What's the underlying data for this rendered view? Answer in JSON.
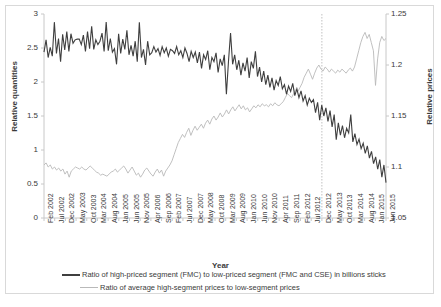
{
  "chart_data": {
    "type": "line",
    "title": "",
    "xlabel": "Year",
    "ylabel": "Relative quantities",
    "ylabel_secondary": "Relative prices",
    "ylim": [
      0,
      3
    ],
    "yticks": [
      "0",
      "0.5",
      "1",
      "1.5",
      "2",
      "2.5",
      "3"
    ],
    "ylim_secondary": [
      1.05,
      1.25
    ],
    "yticks_secondary": [
      "1.05",
      "1.1",
      "1.15",
      "1.2",
      "1.25"
    ],
    "grid": false,
    "legend_position": "bottom",
    "annotations": [
      {
        "type": "vertical-dotted-line",
        "at": "Dec 2012"
      }
    ],
    "tick_labels": [
      "Feb 2002",
      "Jul 2002",
      "Dec 2002",
      "May 2003",
      "Oct 2003",
      "Mar 2004",
      "Aug 2004",
      "Jan 2005",
      "Jun 2005",
      "Nov 2005",
      "Apr 2006",
      "Sep 2006",
      "Feb 2007",
      "Jul 2007",
      "Dec 2007",
      "May 2008",
      "Oct 2008",
      "Mar 2009",
      "Aug 2009",
      "Jan 2010",
      "Jun 2010",
      "Nov 2010",
      "Apr 2011",
      "Sep 2011",
      "Feb 2012",
      "Jul 2012",
      "Dec 2012",
      "May 2013",
      "Oct 2013",
      "Mar 2014",
      "Aug 2014",
      "Jan 2015",
      "Jun 2015"
    ],
    "x_start": "Feb 2002",
    "x_end": "Jun 2015",
    "n_points": 161,
    "series": [
      {
        "name": "Ratio of high-priced segment (FMC) to low-priced segment (FMC and CSE) in billions sticks",
        "axis": "left",
        "color": "#3f3f3f",
        "width": 1.1,
        "values": [
          2.44,
          2.62,
          2.36,
          2.51,
          2.38,
          2.88,
          2.42,
          2.64,
          2.3,
          2.7,
          2.47,
          2.74,
          2.45,
          2.71,
          2.57,
          2.62,
          2.63,
          2.63,
          2.55,
          2.69,
          2.45,
          2.74,
          2.49,
          2.82,
          2.48,
          2.62,
          2.55,
          2.6,
          2.72,
          2.45,
          2.88,
          2.46,
          2.64,
          2.44,
          2.49,
          2.26,
          2.71,
          2.42,
          2.63,
          2.48,
          2.76,
          2.4,
          2.54,
          2.38,
          2.6,
          2.3,
          2.88,
          2.36,
          2.48,
          2.25,
          2.6,
          2.4,
          2.43,
          2.52,
          2.44,
          2.49,
          2.39,
          2.52,
          2.43,
          2.5,
          2.38,
          2.48,
          2.46,
          2.42,
          2.52,
          2.4,
          2.46,
          2.36,
          2.5,
          2.42,
          2.3,
          2.45,
          2.36,
          2.44,
          2.28,
          2.44,
          2.2,
          2.4,
          2.33,
          2.46,
          2.18,
          2.36,
          2.3,
          2.43,
          2.14,
          2.34,
          2.24,
          2.4,
          1.82,
          2.3,
          2.72,
          2.26,
          2.4,
          2.18,
          2.32,
          2.1,
          2.28,
          2.16,
          2.36,
          2.06,
          2.3,
          2.2,
          2.45,
          2.08,
          2.22,
          2.0,
          2.16,
          1.96,
          2.1,
          1.92,
          2.06,
          1.88,
          2.02,
          1.95,
          2.08,
          1.9,
          1.96,
          1.82,
          1.94,
          1.86,
          1.98,
          1.8,
          1.9,
          1.77,
          1.87,
          1.72,
          1.8,
          1.66,
          1.76,
          1.7,
          1.74,
          1.55,
          1.7,
          1.44,
          1.66,
          1.5,
          1.62,
          1.42,
          1.58,
          1.34,
          1.52,
          1.15,
          1.4,
          1.22,
          1.36,
          1.18,
          1.32,
          1.25,
          1.52,
          1.12,
          1.24,
          1.08,
          1.16,
          1.02,
          1.1,
          0.95,
          1.06,
          0.88,
          0.98,
          0.8,
          0.9,
          0.72,
          0.86,
          0.6,
          0.78,
          0.52
        ]
      },
      {
        "name": "Ratio of average high-segment prices to low-segment prices",
        "axis": "right",
        "color": "#b9b9b9",
        "width": 0.9,
        "values_right_axis": [
          1.102,
          1.104,
          1.1,
          1.102,
          1.098,
          1.1,
          1.097,
          1.099,
          1.096,
          1.098,
          1.093,
          1.096,
          1.09,
          1.096,
          1.098,
          1.1,
          1.099,
          1.098,
          1.1,
          1.098,
          1.097,
          1.099,
          1.101,
          1.099,
          1.097,
          1.095,
          1.094,
          1.092,
          1.093,
          1.092,
          1.091,
          1.093,
          1.095,
          1.096,
          1.098,
          1.095,
          1.097,
          1.099,
          1.101,
          1.098,
          1.094,
          1.097,
          1.1,
          1.096,
          1.092,
          1.094,
          1.09,
          1.093,
          1.097,
          1.099,
          1.096,
          1.093,
          1.091,
          1.095,
          1.098,
          1.094,
          1.097,
          1.091,
          1.096,
          1.099,
          1.102,
          1.106,
          1.112,
          1.118,
          1.124,
          1.128,
          1.132,
          1.129,
          1.134,
          1.138,
          1.131,
          1.136,
          1.14,
          1.136,
          1.139,
          1.142,
          1.138,
          1.143,
          1.146,
          1.142,
          1.147,
          1.15,
          1.146,
          1.149,
          1.153,
          1.149,
          1.152,
          1.156,
          1.152,
          1.156,
          1.159,
          1.155,
          1.158,
          1.161,
          1.157,
          1.16,
          1.156,
          1.158,
          1.154,
          1.157,
          1.16,
          1.158,
          1.161,
          1.159,
          1.162,
          1.16,
          1.161,
          1.159,
          1.162,
          1.16,
          1.163,
          1.161,
          1.16,
          1.162,
          1.164,
          1.168,
          1.172,
          1.17,
          1.168,
          1.172,
          1.176,
          1.174,
          1.178,
          1.182,
          1.188,
          1.192,
          1.196,
          1.191,
          1.186,
          1.192,
          1.197,
          1.2,
          1.196,
          1.194,
          1.198,
          1.196,
          1.193,
          1.196,
          1.194,
          1.192,
          1.195,
          1.193,
          1.196,
          1.194,
          1.192,
          1.195,
          1.197,
          1.194,
          1.198,
          1.206,
          1.214,
          1.222,
          1.228,
          1.232,
          1.226,
          1.23,
          1.222,
          1.214,
          1.18,
          1.206,
          1.222,
          1.228,
          1.224,
          1.226
        ]
      }
    ]
  },
  "legend": {
    "items": [
      {
        "label": "Ratio of high-priced segment (FMC) to low-priced segment (FMC and CSE) in billions sticks",
        "style": "dark"
      },
      {
        "label": "Ratio of average high-segment prices to low-segment prices",
        "style": "grey"
      }
    ]
  },
  "axes": {
    "left_title": "Relative quantities",
    "right_title": "Relative prices",
    "x_title": "Year"
  }
}
